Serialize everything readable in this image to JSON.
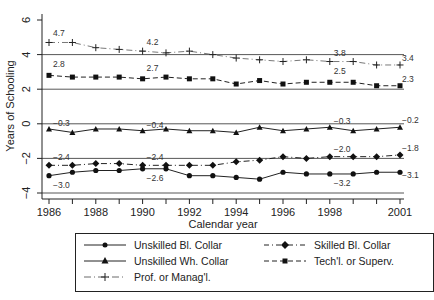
{
  "chart_data": {
    "type": "line",
    "title": "",
    "xlabel": "Calendar year",
    "ylabel": "Years of Schooling",
    "ylim": [
      -4,
      6
    ],
    "xlim": [
      1986,
      2001
    ],
    "yticks": [
      "-4",
      "-2",
      "0",
      "2",
      "4",
      "6"
    ],
    "xticks": [
      "1986",
      "1988",
      "1990",
      "1992",
      "1994",
      "1996",
      "1998",
      "2001"
    ],
    "grid": "horizontal reference lines at -4, -2, 0, 2, 4",
    "legend_position": "bottom",
    "x": [
      1986,
      1987,
      1988,
      1989,
      1990,
      1991,
      1992,
      1993,
      1994,
      1995,
      1996,
      1997,
      1998,
      1999,
      2000,
      2001
    ],
    "series": [
      {
        "name": "Unskilled Bl. Collar",
        "marker": "circle",
        "line": "solid",
        "values": [
          -3.0,
          -2.8,
          -2.7,
          -2.7,
          -2.6,
          -2.6,
          -3.0,
          -3.0,
          -3.1,
          -3.2,
          -2.8,
          -2.9,
          -2.9,
          -2.9,
          -2.8,
          -2.8
        ]
      },
      {
        "name": "Skilled Bl. Collar",
        "marker": "diamond",
        "line": "dash-dot",
        "values": [
          -2.4,
          -2.4,
          -2.3,
          -2.3,
          -2.4,
          -2.4,
          -2.4,
          -2.4,
          -2.2,
          -2.1,
          -1.9,
          -2.0,
          -1.9,
          -1.9,
          -1.9,
          -1.8
        ]
      },
      {
        "name": "Unskilled Wh. Collar",
        "marker": "triangle",
        "line": "solid",
        "values": [
          -0.3,
          -0.5,
          -0.3,
          -0.3,
          -0.4,
          -0.3,
          -0.4,
          -0.4,
          -0.5,
          -0.2,
          -0.4,
          -0.3,
          -0.2,
          -0.4,
          -0.3,
          -0.2
        ]
      },
      {
        "name": "Tech'l. or Superv.",
        "marker": "square",
        "line": "dashed",
        "values": [
          2.8,
          2.7,
          2.7,
          2.7,
          2.6,
          2.7,
          2.6,
          2.6,
          2.3,
          2.5,
          2.3,
          2.4,
          2.4,
          2.4,
          2.2,
          2.2
        ]
      },
      {
        "name": "Prof. or Manag'l.",
        "marker": "plus",
        "line": "dash-dot",
        "values": [
          4.7,
          4.7,
          4.4,
          4.3,
          4.2,
          4.1,
          4.2,
          4.0,
          3.8,
          3.7,
          3.6,
          3.7,
          3.6,
          3.6,
          3.4,
          3.4
        ]
      }
    ],
    "annotations": [
      {
        "series": "Prof. or Manag'l.",
        "labels": [
          {
            "x": 1986,
            "text": "4.7"
          },
          {
            "x": 1990,
            "text": "4.2"
          },
          {
            "x": 1998,
            "text": "3.8"
          },
          {
            "x": 2001,
            "text": "3.4"
          }
        ]
      },
      {
        "series": "Tech'l. or Superv.",
        "labels": [
          {
            "x": 1986,
            "text": "2.8"
          },
          {
            "x": 1990,
            "text": "2.7"
          },
          {
            "x": 1998,
            "text": "2.5"
          },
          {
            "x": 2001,
            "text": "2.3"
          }
        ]
      },
      {
        "series": "Unskilled Wh. Collar",
        "labels": [
          {
            "x": 1986,
            "text": "-0.3"
          },
          {
            "x": 1990,
            "text": "-0.4"
          },
          {
            "x": 1998,
            "text": "-0.3"
          },
          {
            "x": 2001,
            "text": "-0.2"
          }
        ]
      },
      {
        "series": "Skilled Bl. Collar",
        "labels": [
          {
            "x": 1986,
            "text": "-2.4"
          },
          {
            "x": 1990,
            "text": "-2.4"
          },
          {
            "x": 1998,
            "text": "-2.0"
          },
          {
            "x": 2001,
            "text": "-1.8"
          }
        ]
      },
      {
        "series": "Unskilled Bl. Collar",
        "labels": [
          {
            "x": 1986,
            "text": "-3.0"
          },
          {
            "x": 1990,
            "text": "-2.6"
          },
          {
            "x": 1998,
            "text": "-3.2"
          },
          {
            "x": 2001,
            "text": "-3.1"
          }
        ]
      }
    ]
  },
  "legend": {
    "items": [
      {
        "label": "Unskilled Bl. Collar"
      },
      {
        "label": "Skilled Bl. Collar"
      },
      {
        "label": "Unskilled Wh. Collar"
      },
      {
        "label": "Tech'l. or Superv."
      },
      {
        "label": "Prof. or Manag'l."
      }
    ]
  }
}
